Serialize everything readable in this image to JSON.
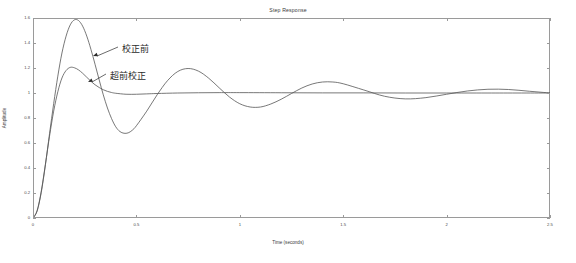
{
  "chart_data": {
    "type": "line",
    "title": "Step Response",
    "xlabel": "Time (seconds)",
    "ylabel": "Amplitude",
    "xlim": [
      0,
      2.5
    ],
    "ylim": [
      0,
      1.6
    ],
    "grid": false,
    "legend_position": "none",
    "xticks": [
      0,
      0.5,
      1,
      1.5,
      2,
      2.5
    ],
    "xtick_labels": [
      "0",
      "0.5",
      "1",
      "1.5",
      "2",
      "2.5"
    ],
    "yticks": [
      0,
      0.2,
      0.4,
      0.6,
      0.8,
      1,
      1.2,
      1.4,
      1.6
    ],
    "ytick_labels": [
      "0",
      "0.2",
      "0.4",
      "0.6",
      "0.8",
      "1",
      "1.2",
      "1.4",
      "1.6"
    ],
    "series": [
      {
        "name": "校正前",
        "description": "uncompensated step response, lightly damped",
        "color": "#555555",
        "peak_value": 1.59,
        "peak_time": 0.21,
        "trough_value": 0.68,
        "trough_time": 0.45,
        "steady_state": 1.0,
        "damping_ratio": 0.15,
        "natural_frequency": 14.5,
        "x": [
          0,
          0.02,
          0.04,
          0.06,
          0.08,
          0.1,
          0.12,
          0.14,
          0.16,
          0.18,
          0.2,
          0.22,
          0.24,
          0.26,
          0.28,
          0.3,
          0.32,
          0.34,
          0.36,
          0.38,
          0.4,
          0.42,
          0.44,
          0.46,
          0.48,
          0.5,
          0.55,
          0.6,
          0.65,
          0.7,
          0.75,
          0.8,
          0.85,
          0.9,
          0.95,
          1.0,
          1.05,
          1.1,
          1.15,
          1.2,
          1.25,
          1.3,
          1.35,
          1.4,
          1.45,
          1.5,
          1.6,
          1.7,
          1.8,
          1.9,
          2.0,
          2.1,
          2.2,
          2.3,
          2.4,
          2.5
        ],
        "y": [
          0,
          0.055,
          0.205,
          0.425,
          0.675,
          0.915,
          1.135,
          1.32,
          1.455,
          1.545,
          1.585,
          1.58,
          1.535,
          1.455,
          1.35,
          1.23,
          1.105,
          0.985,
          0.88,
          0.795,
          0.73,
          0.692,
          0.678,
          0.681,
          0.702,
          0.738,
          0.855,
          0.985,
          1.098,
          1.172,
          1.196,
          1.175,
          1.118,
          1.042,
          0.968,
          0.914,
          0.888,
          0.888,
          0.912,
          0.95,
          0.996,
          1.04,
          1.072,
          1.088,
          1.088,
          1.074,
          1.024,
          0.974,
          0.953,
          0.963,
          0.99,
          1.016,
          1.03,
          1.028,
          1.014,
          1.0
        ]
      },
      {
        "name": "超前校正",
        "description": "lead-compensated step response, well damped",
        "color": "#555555",
        "peak_value": 1.205,
        "peak_time": 0.175,
        "steady_state": 1.0,
        "damping_ratio": 0.55,
        "natural_frequency": 18.0,
        "x": [
          0,
          0.02,
          0.04,
          0.06,
          0.08,
          0.1,
          0.12,
          0.14,
          0.16,
          0.18,
          0.2,
          0.22,
          0.24,
          0.26,
          0.28,
          0.3,
          0.32,
          0.34,
          0.36,
          0.38,
          0.4,
          0.45,
          0.5,
          0.55,
          0.6,
          0.7,
          0.8,
          0.9,
          1.0,
          1.2,
          1.4,
          1.6,
          1.8,
          2.0,
          2.2,
          2.5
        ],
        "y": [
          0,
          0.06,
          0.215,
          0.43,
          0.655,
          0.855,
          1.01,
          1.12,
          1.18,
          1.205,
          1.202,
          1.185,
          1.158,
          1.126,
          1.094,
          1.066,
          1.044,
          1.026,
          1.013,
          1.004,
          0.998,
          0.99,
          0.99,
          0.993,
          0.996,
          1.0,
          1.002,
          1.003,
          1.003,
          1.002,
          1.001,
          1.001,
          1.0,
          1.0,
          1.0,
          1.0
        ]
      }
    ],
    "annotations": [
      {
        "text": "校正前",
        "label_x": 122,
        "label_y": 48,
        "arrow_tip_x": 93,
        "arrow_tip_y": 57,
        "points_to_series": "校正前"
      },
      {
        "text": "超前校正",
        "label_x": 110,
        "label_y": 75,
        "arrow_tip_x": 88,
        "arrow_tip_y": 83,
        "points_to_series": "超前校正"
      }
    ]
  }
}
